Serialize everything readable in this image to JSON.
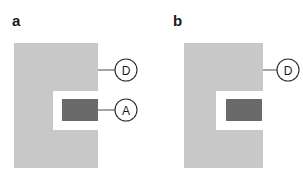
{
  "figure": {
    "width": 303,
    "height": 179,
    "background_color": "#ffffff",
    "type": "two-panel-schematic"
  },
  "colors": {
    "block_fill": "#c8c8c8",
    "insert_fill": "#6a6a6a",
    "line_stroke": "#4a4a4a",
    "circle_stroke": "#2b2b2b",
    "circle_fill": "#ffffff",
    "text_color": "#1a1a1a",
    "background": "#ffffff"
  },
  "panels": [
    {
      "id": "panel-a",
      "letter": "a",
      "letter_pos": {
        "x": 12,
        "y": 26
      },
      "block": {
        "x": 14,
        "y": 43,
        "width": 84,
        "height": 125,
        "notch": {
          "x": 53,
          "y": 91,
          "width": 45,
          "height": 39
        }
      },
      "insert": {
        "x": 62,
        "y": 99,
        "width": 36,
        "height": 22,
        "label": "A"
      },
      "callouts": [
        {
          "label": "D",
          "circle": {
            "cx": 126,
            "cy": 70,
            "r": 11
          },
          "leader": {
            "x1": 98,
            "y1": 70,
            "x2": 115,
            "y2": 70
          },
          "target": "block"
        },
        {
          "label": "A",
          "circle": {
            "cx": 126,
            "cy": 110,
            "r": 11
          },
          "leader": {
            "x1": 98,
            "y1": 110,
            "x2": 115,
            "y2": 110
          },
          "target": "insert"
        }
      ]
    },
    {
      "id": "panel-b",
      "letter": "b",
      "letter_pos": {
        "x": 173,
        "y": 26
      },
      "block": {
        "x": 184,
        "y": 43,
        "width": 79,
        "height": 125,
        "notch": {
          "x": 216,
          "y": 91,
          "width": 47,
          "height": 39
        }
      },
      "insert": {
        "x": 226,
        "y": 99,
        "width": 36,
        "height": 22,
        "label": "A"
      },
      "callouts": [
        {
          "label": "D",
          "circle": {
            "cx": 288,
            "cy": 70,
            "r": 11
          },
          "leader": {
            "x1": 263,
            "y1": 70,
            "x2": 277,
            "y2": 70
          },
          "target": "block"
        }
      ]
    }
  ],
  "labels": {
    "panel_a_letter": "a",
    "panel_b_letter": "b",
    "callout_d": "D",
    "callout_a": "A"
  }
}
